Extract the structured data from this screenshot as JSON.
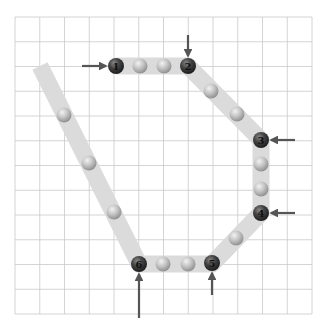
{
  "diagram": {
    "type": "path-on-grid",
    "grid": {
      "left": 15,
      "top": 17,
      "right": 312,
      "bottom": 314,
      "columns": 12,
      "rows": 12,
      "line_color": "#c9c9c9"
    },
    "band_color": "#d9d9d9",
    "band_width": 17,
    "path_points": [
      {
        "x": 40,
        "y": 66
      },
      {
        "x": 139,
        "y": 264
      },
      {
        "x": 212,
        "y": 264
      },
      {
        "x": 261,
        "y": 213
      },
      {
        "x": 261,
        "y": 140
      },
      {
        "x": 188,
        "y": 66
      },
      {
        "x": 116,
        "y": 66
      }
    ],
    "key_points": [
      {
        "label": "1",
        "x": 116,
        "y": 66,
        "arrow": "from-left"
      },
      {
        "label": "2",
        "x": 188,
        "y": 66,
        "arrow": "from-top"
      },
      {
        "label": "3",
        "x": 261,
        "y": 140,
        "arrow": "from-right"
      },
      {
        "label": "4",
        "x": 261,
        "y": 213,
        "arrow": "from-right"
      },
      {
        "label": "5",
        "x": 212,
        "y": 263,
        "arrow": "from-bottom"
      },
      {
        "label": "6",
        "x": 139,
        "y": 264,
        "arrow": "from-bottom-long"
      }
    ],
    "intermediate_points": [
      {
        "x": 140,
        "y": 66
      },
      {
        "x": 164,
        "y": 66
      },
      {
        "x": 211,
        "y": 91
      },
      {
        "x": 237,
        "y": 114
      },
      {
        "x": 261,
        "y": 164
      },
      {
        "x": 261,
        "y": 189
      },
      {
        "x": 236,
        "y": 238
      },
      {
        "x": 163,
        "y": 264
      },
      {
        "x": 188,
        "y": 264
      },
      {
        "x": 64,
        "y": 115
      },
      {
        "x": 89,
        "y": 163
      },
      {
        "x": 114,
        "y": 212
      }
    ],
    "colors": {
      "key_ball": "#3a3a3a",
      "intermediate_ball": "#b9b9b9",
      "arrow": "#555555"
    }
  }
}
